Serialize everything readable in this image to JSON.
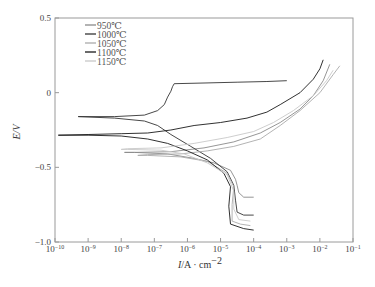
{
  "chart_data": {
    "type": "line",
    "title": "",
    "xlabel": "I/A · cm⁻²",
    "xlabel_var": "I",
    "xlabel_unit": "/A · cm",
    "xlabel_exp": "−2",
    "ylabel": "E/V",
    "xscale": "log",
    "xlim_log10": [
      -10,
      -1
    ],
    "ylim": [
      -1.0,
      0.5
    ],
    "x_ticks": [
      "10⁻¹⁰",
      "10⁻⁹",
      "10⁻⁸",
      "10⁻⁷",
      "10⁻⁶",
      "10⁻⁵",
      "10⁻⁴",
      "10⁻³",
      "10⁻²",
      "10⁻¹"
    ],
    "x_tick_exponents": [
      -10,
      -9,
      -8,
      -7,
      -6,
      -5,
      -4,
      -3,
      -2,
      -1
    ],
    "y_ticks": [
      "0.5",
      "0",
      "−0.5",
      "−1.0"
    ],
    "y_tick_values": [
      0.5,
      0,
      -0.5,
      -1.0
    ],
    "grid": false,
    "legend_position": "upper-left",
    "series": [
      {
        "name": "950℃",
        "color": "#8a8a8a",
        "points_log10I_E": [
          [
            -4.0,
            -0.7
          ],
          [
            -4.3,
            -0.7
          ],
          [
            -4.45,
            -0.67
          ],
          [
            -4.5,
            -0.62
          ],
          [
            -4.55,
            -0.58
          ],
          [
            -4.7,
            -0.52
          ],
          [
            -5.2,
            -0.47
          ],
          [
            -5.8,
            -0.44
          ],
          [
            -6.6,
            -0.41
          ],
          [
            -7.6,
            -0.4
          ],
          [
            -7.9,
            -0.4
          ],
          [
            -7.6,
            -0.4
          ],
          [
            -6.5,
            -0.395
          ],
          [
            -5.5,
            -0.37
          ],
          [
            -4.6,
            -0.33
          ],
          [
            -3.8,
            -0.27
          ],
          [
            -3.2,
            -0.2
          ],
          [
            -2.6,
            -0.11
          ],
          [
            -2.2,
            -0.02
          ],
          [
            -1.9,
            0.08
          ],
          [
            -1.7,
            0.19
          ]
        ]
      },
      {
        "name": "1000℃",
        "color": "#333333",
        "points_log10I_E": [
          [
            -4.0,
            -0.82
          ],
          [
            -4.3,
            -0.82
          ],
          [
            -4.5,
            -0.8
          ],
          [
            -4.55,
            -0.72
          ],
          [
            -4.6,
            -0.62
          ],
          [
            -4.8,
            -0.53
          ],
          [
            -5.3,
            -0.44
          ],
          [
            -5.9,
            -0.36
          ],
          [
            -6.5,
            -0.28
          ],
          [
            -6.9,
            -0.22
          ],
          [
            -7.3,
            -0.19
          ],
          [
            -8.2,
            -0.17
          ],
          [
            -9.3,
            -0.16
          ],
          [
            -8.2,
            -0.16
          ],
          [
            -7.3,
            -0.15
          ],
          [
            -6.9,
            -0.12
          ],
          [
            -6.7,
            -0.08
          ],
          [
            -6.6,
            -0.03
          ],
          [
            -6.5,
            0.01
          ],
          [
            -6.45,
            0.04
          ],
          [
            -6.4,
            0.06
          ],
          [
            -5.5,
            0.065
          ],
          [
            -4.5,
            0.07
          ],
          [
            -3.6,
            0.075
          ],
          [
            -3.0,
            0.08
          ]
        ]
      },
      {
        "name": "1050℃",
        "color": "#aaaaaa",
        "points_log10I_E": [
          [
            -4.1,
            -0.89
          ],
          [
            -4.4,
            -0.88
          ],
          [
            -4.65,
            -0.86
          ],
          [
            -4.65,
            -0.75
          ],
          [
            -4.6,
            -0.63
          ],
          [
            -4.8,
            -0.54
          ],
          [
            -5.4,
            -0.46
          ],
          [
            -6.2,
            -0.43
          ],
          [
            -7.2,
            -0.42
          ],
          [
            -7.5,
            -0.42
          ],
          [
            -7.2,
            -0.415
          ],
          [
            -6.2,
            -0.41
          ],
          [
            -5.4,
            -0.39
          ],
          [
            -4.6,
            -0.36
          ],
          [
            -3.8,
            -0.31
          ],
          [
            -3.2,
            -0.22
          ],
          [
            -2.6,
            -0.12
          ],
          [
            -2.0,
            0.0
          ],
          [
            -1.6,
            0.12
          ],
          [
            -1.4,
            0.18
          ]
        ]
      },
      {
        "name": "1100℃",
        "color": "#1a1a1a",
        "points_log10I_E": [
          [
            -4.0,
            -0.92
          ],
          [
            -4.3,
            -0.91
          ],
          [
            -4.7,
            -0.88
          ],
          [
            -4.75,
            -0.76
          ],
          [
            -4.7,
            -0.63
          ],
          [
            -4.9,
            -0.54
          ],
          [
            -5.4,
            -0.45
          ],
          [
            -6.0,
            -0.39
          ],
          [
            -6.6,
            -0.34
          ],
          [
            -7.2,
            -0.31
          ],
          [
            -8.0,
            -0.29
          ],
          [
            -9.0,
            -0.285
          ],
          [
            -9.9,
            -0.285
          ],
          [
            -9.0,
            -0.28
          ],
          [
            -8.0,
            -0.275
          ],
          [
            -7.2,
            -0.27
          ],
          [
            -6.5,
            -0.25
          ],
          [
            -5.8,
            -0.22
          ],
          [
            -5.0,
            -0.2
          ],
          [
            -4.2,
            -0.17
          ],
          [
            -3.6,
            -0.13
          ],
          [
            -3.2,
            -0.08
          ],
          [
            -2.6,
            0.0
          ],
          [
            -2.2,
            0.09
          ],
          [
            -2.0,
            0.16
          ],
          [
            -1.9,
            0.22
          ]
        ]
      },
      {
        "name": "1150℃",
        "color": "#c8c8c8",
        "points_log10I_E": [
          [
            -4.1,
            -0.86
          ],
          [
            -4.45,
            -0.85
          ],
          [
            -4.6,
            -0.78
          ],
          [
            -4.6,
            -0.66
          ],
          [
            -4.8,
            -0.55
          ],
          [
            -5.4,
            -0.47
          ],
          [
            -6.1,
            -0.41
          ],
          [
            -6.8,
            -0.385
          ],
          [
            -7.8,
            -0.38
          ],
          [
            -8.0,
            -0.38
          ],
          [
            -7.8,
            -0.375
          ],
          [
            -6.8,
            -0.37
          ],
          [
            -5.8,
            -0.34
          ],
          [
            -4.8,
            -0.3
          ],
          [
            -4.0,
            -0.26
          ],
          [
            -3.4,
            -0.2
          ],
          [
            -2.8,
            -0.12
          ],
          [
            -2.2,
            -0.02
          ],
          [
            -1.8,
            0.08
          ],
          [
            -1.6,
            0.15
          ]
        ]
      }
    ]
  }
}
